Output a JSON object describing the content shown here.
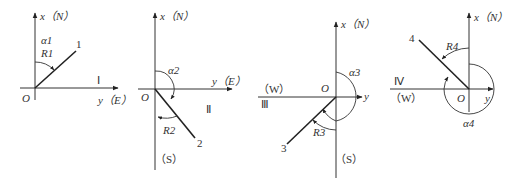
{
  "diagram": {
    "type": "quadrant-bearing-diagrams",
    "panels": [
      {
        "quadrant": "I",
        "origin_label": "O",
        "axis_x_label": "x（N）",
        "axis_y_label": "y（E）",
        "line_label": "1",
        "angle_alpha": "α1",
        "angle_R": "R1",
        "quadrant_roman": "Ⅰ"
      },
      {
        "quadrant": "II",
        "origin_label": "O",
        "axis_x_label": "x（N）",
        "axis_y_label": "y（E）",
        "south_label": "（S）",
        "line_label": "2",
        "angle_alpha": "α2",
        "angle_R": "R2",
        "quadrant_roman": "Ⅱ"
      },
      {
        "quadrant": "III",
        "origin_label": "O",
        "axis_x_label": "x（N）",
        "axis_y_label": "y",
        "west_label": "（W）",
        "south_label": "（S）",
        "line_label": "3",
        "angle_alpha": "α3",
        "angle_R": "R3",
        "quadrant_roman": "Ⅲ"
      },
      {
        "quadrant": "IV",
        "origin_label": "O",
        "axis_x_label": "x（N）",
        "axis_y_label": "y",
        "west_label": "（W）",
        "line_label": "4",
        "angle_alpha": "α4",
        "angle_R": "R4",
        "quadrant_roman": "Ⅳ"
      }
    ]
  }
}
